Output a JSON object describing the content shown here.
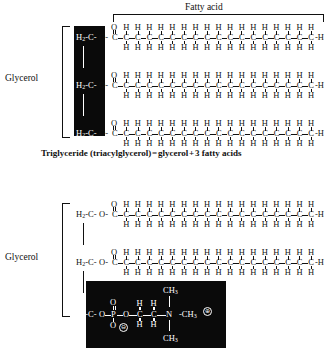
{
  "figure": {
    "top_label": "Fatty acid",
    "glycerol_label": "Glycerol",
    "caption": "Triglyceride (triacylglycerol) = glycerol + 3 fatty acids"
  },
  "atoms": {
    "H2": "H",
    "two": "2",
    "C": "C",
    "O": "O",
    "H": "H",
    "P": "P",
    "N": "N",
    "CH3_C": "C",
    "CH3_H": "H",
    "CH3_3": "3",
    "dash": "-",
    "plus": "⊕",
    "minus": "⊖"
  },
  "structures": {
    "triglyceride": {
      "name": "triglyceride",
      "glycerol_units": 3,
      "chains": 3,
      "chain_carbons": 18,
      "glycerol_highlighted": true,
      "head_group": "none"
    },
    "phospholipid": {
      "name": "phospholipid",
      "glycerol_units": 3,
      "chains": 2,
      "chain_carbons": 18,
      "glycerol_highlighted": false,
      "head_group": "phosphocholine",
      "head_atoms": [
        "O",
        "P",
        "O",
        "C",
        "C",
        "N",
        "CH3",
        "CH3",
        "CH3"
      ],
      "charges": [
        "⊖ on phosphate oxygen",
        "⊕ on nitrogen"
      ]
    }
  },
  "chain_labels": {
    "terminal_H": "H",
    "carbonyl_O": "O",
    "ester_O": "O"
  }
}
